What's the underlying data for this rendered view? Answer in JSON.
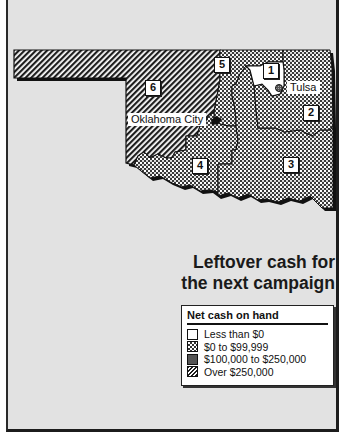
{
  "title": {
    "line1": "Leftover cash for",
    "line2": "the next campaign"
  },
  "legend": {
    "title": "Net cash on hand",
    "items": [
      {
        "label": "Less than $0",
        "pattern": "white",
        "color": "#ffffff"
      },
      {
        "label": "$0 to $99,999",
        "pattern": "checker",
        "color": "#9a9a9a"
      },
      {
        "label": "$100,000 to $250,000",
        "pattern": "dense-dots",
        "color": "#6e6e6e"
      },
      {
        "label": "Over $250,000",
        "pattern": "diagonal-hatch",
        "color": "#3a3a3a"
      }
    ]
  },
  "districts": [
    {
      "id": "1",
      "label": "1",
      "category": "Less than $0"
    },
    {
      "id": "2",
      "label": "2",
      "category": "$0 to $99,999"
    },
    {
      "id": "3",
      "label": "3",
      "category": "$0 to $99,999"
    },
    {
      "id": "4",
      "label": "4",
      "category": "$0 to $99,999"
    },
    {
      "id": "5",
      "label": "5",
      "category": "$0 to $99,999"
    },
    {
      "id": "6",
      "label": "6",
      "category": "Over $250,000"
    }
  ],
  "cities": [
    {
      "name": "Tulsa"
    },
    {
      "name": "Oklahoma City"
    }
  ],
  "map": {
    "state": "Oklahoma",
    "colors": {
      "background": "#e2e2e2",
      "outline": "#111111",
      "shadow": "#1a1a1a"
    }
  }
}
